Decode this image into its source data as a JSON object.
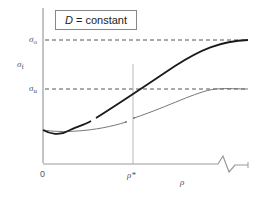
{
  "figure": {
    "legend_box": {
      "variable": "D",
      "equals": "= constant"
    },
    "y_axis": {
      "label": "σ",
      "label_sub": "f",
      "ticks": [
        {
          "symbol": "σ",
          "sub": "o",
          "y_px": 40
        },
        {
          "symbol": "σ",
          "sub": "u",
          "y_px": 89
        }
      ]
    },
    "x_axis": {
      "label": "ρ",
      "origin_label": "0",
      "marker_label": "ρ*",
      "axis_break": true
    },
    "curves": [
      {
        "name": "upper-curve",
        "color": "#1a1a1a",
        "width": 1.8,
        "asymptote": "σo"
      },
      {
        "name": "lower-curve",
        "color": "#777777",
        "width": 1.0,
        "asymptote": "σu"
      }
    ],
    "colors": {
      "axis": "#888888",
      "dashed": "#555555",
      "text": "#555555"
    }
  }
}
